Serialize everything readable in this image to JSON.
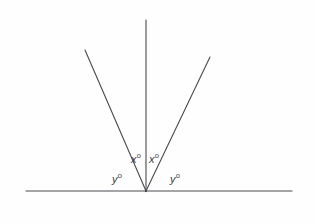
{
  "figure": {
    "kind": "geometry-diagram",
    "background_color": "#fefefe",
    "stroke_color": "#4a4a4f",
    "label_color": "#3b3b3f",
    "stroke_width": 1.1,
    "width": 315,
    "height": 224
  },
  "points": [
    {
      "id": "P",
      "label": "P",
      "x": 17,
      "y": 191,
      "anchor": "anchor-c"
    },
    {
      "id": "R",
      "label": "R",
      "x": 299,
      "y": 191,
      "anchor": "anchor-c"
    },
    {
      "id": "Q",
      "label": "Q",
      "x": 146,
      "y": 203,
      "anchor": "anchor-c"
    },
    {
      "id": "S",
      "label": "S",
      "x": 78,
      "y": 38,
      "anchor": "anchor-c"
    },
    {
      "id": "T",
      "label": "T",
      "x": 146,
      "y": 12,
      "anchor": "anchor-c"
    },
    {
      "id": "V",
      "label": "V",
      "x": 214,
      "y": 46,
      "anchor": "anchor-c"
    }
  ],
  "segments": [
    {
      "id": "line-PR",
      "name": "straight-line-p-r",
      "x1": 26,
      "y1": 191,
      "x2": 292,
      "y2": 191
    },
    {
      "id": "ray-QT",
      "name": "ray-q-t",
      "x1": 146,
      "y1": 191,
      "x2": 146,
      "y2": 20
    },
    {
      "id": "ray-QS",
      "name": "ray-q-s",
      "x1": 146,
      "y1": 191,
      "x2": 85,
      "y2": 50
    },
    {
      "id": "ray-QV",
      "name": "ray-q-v",
      "x1": 146,
      "y1": 191,
      "x2": 210,
      "y2": 57
    }
  ],
  "angles": [
    {
      "id": "angle-SQT",
      "variable": "x",
      "degree_mark": "o",
      "x": 136,
      "y": 159,
      "anchor": "anchor-c"
    },
    {
      "id": "angle-TQV",
      "variable": "x",
      "degree_mark": "o",
      "x": 154,
      "y": 159,
      "anchor": "anchor-c"
    },
    {
      "id": "angle-PQS",
      "variable": "y",
      "degree_mark": "o",
      "x": 117,
      "y": 179,
      "anchor": "anchor-c"
    },
    {
      "id": "angle-VQR",
      "variable": "y",
      "degree_mark": "o",
      "x": 175,
      "y": 179,
      "anchor": "anchor-c"
    }
  ]
}
